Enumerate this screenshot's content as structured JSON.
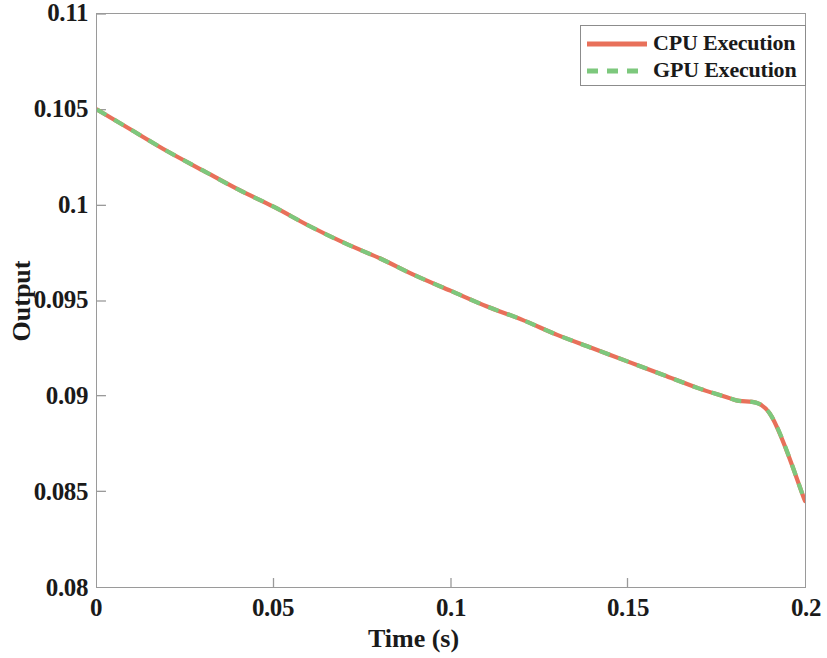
{
  "chart_data": {
    "type": "line",
    "title": "",
    "xlabel": "Time (s)",
    "ylabel": "Output",
    "xlim": [
      0,
      0.2
    ],
    "ylim": [
      0.08,
      0.11
    ],
    "grid": false,
    "legend_position": "top-right",
    "xticks": [
      0,
      0.05,
      0.1,
      0.15,
      0.2
    ],
    "xtick_labels": [
      "0",
      "0.05",
      "0.1",
      "0.15",
      "0.2"
    ],
    "yticks": [
      0.08,
      0.085,
      0.09,
      0.095,
      0.1,
      0.105,
      0.11
    ],
    "ytick_labels": [
      "0.08",
      "0.085",
      "0.09",
      "0.095",
      "0.1",
      "0.105",
      "0.11"
    ],
    "x": [
      0,
      0.01,
      0.02,
      0.03,
      0.04,
      0.05,
      0.06,
      0.07,
      0.08,
      0.09,
      0.1,
      0.11,
      0.12,
      0.13,
      0.14,
      0.15,
      0.16,
      0.17,
      0.18,
      0.19,
      0.2
    ],
    "series": [
      {
        "name": "CPU Execution",
        "color": "#e8705a",
        "style": "solid",
        "values": [
          0.105,
          0.1039,
          0.1028,
          0.1018,
          0.1008,
          0.0999,
          0.0989,
          0.098,
          0.0972,
          0.0963,
          0.0955,
          0.0947,
          0.094,
          0.0932,
          0.0925,
          0.0918,
          0.0911,
          0.0904,
          0.0898,
          0.0891,
          0.0845
        ]
      },
      {
        "name": "GPU Execution",
        "color": "#7dc87d",
        "style": "dashed",
        "values": [
          0.105,
          0.1039,
          0.1028,
          0.1018,
          0.1008,
          0.0999,
          0.0989,
          0.098,
          0.0972,
          0.0963,
          0.0955,
          0.0947,
          0.094,
          0.0932,
          0.0925,
          0.0918,
          0.0911,
          0.0904,
          0.0898,
          0.0891,
          0.0845
        ]
      }
    ],
    "annotations": []
  },
  "legend": {
    "entries": [
      {
        "label": "CPU Execution"
      },
      {
        "label": "GPU Execution"
      }
    ]
  },
  "axes": {
    "x_title": "Time (s)",
    "y_title": "Output"
  }
}
